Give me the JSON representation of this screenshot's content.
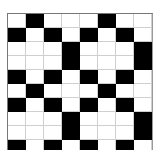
{
  "board": {
    "columns": 8,
    "rows_visible": 10,
    "colors": {
      "filled": "#000000",
      "empty": "#ffffff",
      "grid_line": "#cfcfcf",
      "border": "#777777"
    },
    "cells": [
      [
        0,
        1,
        0,
        0,
        0,
        1,
        0,
        0
      ],
      [
        1,
        0,
        1,
        0,
        1,
        0,
        1,
        0
      ],
      [
        0,
        0,
        0,
        1,
        0,
        0,
        0,
        1
      ],
      [
        0,
        0,
        0,
        1,
        0,
        0,
        0,
        1
      ],
      [
        1,
        0,
        1,
        0,
        1,
        0,
        1,
        0
      ],
      [
        0,
        1,
        0,
        0,
        0,
        1,
        0,
        0
      ],
      [
        1,
        0,
        1,
        0,
        1,
        0,
        1,
        0
      ],
      [
        0,
        0,
        0,
        1,
        0,
        0,
        0,
        1
      ],
      [
        0,
        0,
        0,
        1,
        0,
        0,
        0,
        1
      ],
      [
        1,
        0,
        1,
        0,
        1,
        0,
        1,
        0
      ]
    ]
  }
}
